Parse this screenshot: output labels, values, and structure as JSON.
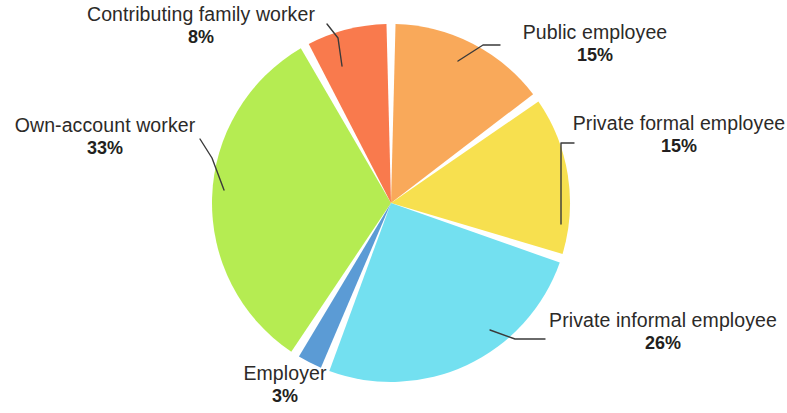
{
  "chart_data": {
    "type": "pie",
    "title": "",
    "subtitle": "",
    "xlabel": "",
    "ylabel": "",
    "legend_position": "none",
    "grid": false,
    "unit": "%",
    "start_angle_deg": -90,
    "direction": "clockwise",
    "categories": [
      "Public employee",
      "Private formal employee",
      "Private informal employee",
      "Employer",
      "Own-account worker",
      "Contributing family worker"
    ],
    "values": [
      15,
      15,
      26,
      3,
      33,
      8
    ],
    "colors": [
      "#F9A95A",
      "#F7E04F",
      "#73E0F0",
      "#5B9BD5",
      "#B5EC52",
      "#F97A4D"
    ],
    "slices": [
      {
        "id": "public-employee",
        "label": "Public employee",
        "value": 15,
        "value_text": "15%",
        "color": "#F9A95A",
        "start_deg": 0,
        "end_deg": 54
      },
      {
        "id": "private-formal-employee",
        "label": "Private formal employee",
        "value": 15,
        "value_text": "15%",
        "color": "#F7E04F",
        "start_deg": 54,
        "end_deg": 108
      },
      {
        "id": "private-informal-employee",
        "label": "Private informal employee",
        "value": 26,
        "value_text": "26%",
        "color": "#73E0F0",
        "start_deg": 108,
        "end_deg": 201.6
      },
      {
        "id": "employer",
        "label": "Employer",
        "value": 3,
        "value_text": "3%",
        "color": "#5B9BD5",
        "start_deg": 201.6,
        "end_deg": 212.4
      },
      {
        "id": "own-account-worker",
        "label": "Own-account worker",
        "value": 33,
        "value_text": "33%",
        "color": "#B5EC52",
        "start_deg": 212.4,
        "end_deg": 331.2
      },
      {
        "id": "contributing-family-worker",
        "label": "Contributing family worker",
        "value": 8,
        "value_text": "8%",
        "color": "#F97A4D",
        "start_deg": 331.2,
        "end_deg": 360
      }
    ]
  },
  "labels": {
    "public_employee": {
      "name": "Public employee",
      "pct": "15%"
    },
    "private_formal_employee": {
      "name": "Private formal employee",
      "pct": "15%"
    },
    "private_informal_employee": {
      "name": "Private informal employee",
      "pct": "26%"
    },
    "employer": {
      "name": "Employer",
      "pct": "3%"
    },
    "own_account_worker": {
      "name": "Own-account worker",
      "pct": "33%"
    },
    "contributing_family_worker": {
      "name": "Contributing family worker",
      "pct": "8%"
    }
  },
  "style": {
    "background": "#ffffff",
    "text_color": "#231f20",
    "leader_line_color": "#3a3a3a",
    "slice_gap_color": "#ffffff"
  }
}
